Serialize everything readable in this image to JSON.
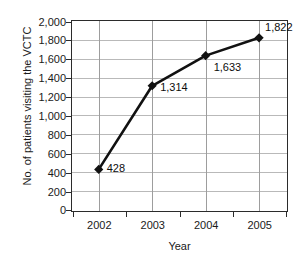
{
  "chart_data": {
    "type": "line",
    "title": "",
    "subtitle": "",
    "xlabel": "Year",
    "ylabel": "No. of patients visiting the VCTC",
    "categories": [
      "2002",
      "2003",
      "2004",
      "2005"
    ],
    "values": [
      428,
      1314,
      1633,
      1822
    ],
    "point_labels": [
      "428",
      "1,314",
      "1,633",
      "1,822"
    ],
    "series": [
      {
        "name": "No. of patients visiting the VCTC",
        "values": [
          428,
          1314,
          1633,
          1822
        ]
      }
    ],
    "ylim": [
      0,
      2000
    ],
    "ytick_values": [
      0,
      200,
      400,
      600,
      800,
      1000,
      1200,
      1400,
      1600,
      1800,
      2000
    ],
    "ytick_labels": [
      "0",
      "200",
      "400",
      "600",
      "800",
      "1,000",
      "1,200",
      "1,400",
      "1,600",
      "1,800",
      "2,000"
    ],
    "grid": {
      "horizontal": true,
      "vertical": true
    },
    "legend": {
      "visible": false,
      "position": "none"
    },
    "marker": "diamond",
    "colors": {
      "line": "#111111",
      "marker": "#111111",
      "gridline": "#b9b9b9",
      "axis": "#2b2b2b",
      "text": "#1a1a1a",
      "background": "#ffffff"
    },
    "annotations": [
      {
        "category": "2002",
        "value": 428,
        "text": "428"
      },
      {
        "category": "2003",
        "value": 1314,
        "text": "1,314"
      },
      {
        "category": "2004",
        "value": 1633,
        "text": "1,633"
      },
      {
        "category": "2005",
        "value": 1822,
        "text": "1,822"
      }
    ]
  }
}
